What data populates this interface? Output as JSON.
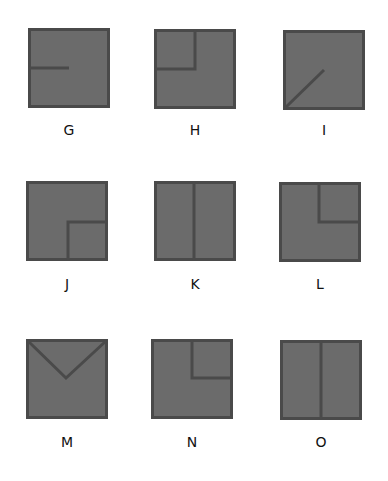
{
  "colors": {
    "fill": "#6b6b6b",
    "stroke": "#4a4a4a",
    "background": "#ffffff",
    "label": "#111111"
  },
  "tiles": [
    {
      "label": "G",
      "x": 28,
      "y": 28,
      "label_y": 122,
      "pattern": "half-horizontal-line-from-left-edge-to-center"
    },
    {
      "label": "H",
      "x": 154,
      "y": 29,
      "label_y": 122,
      "pattern": "top-left-quadrant-outline"
    },
    {
      "label": "I",
      "x": 283,
      "y": 30,
      "label_y": 122,
      "pattern": "diagonal-from-bottom-left-corner-to-center"
    },
    {
      "label": "J",
      "x": 26,
      "y": 181,
      "label_y": 276,
      "pattern": "bottom-right-quadrant-outline"
    },
    {
      "label": "K",
      "x": 154,
      "y": 181,
      "label_y": 276,
      "pattern": "full-vertical-center-line"
    },
    {
      "label": "L",
      "x": 279,
      "y": 182,
      "label_y": 276,
      "pattern": "top-right-quadrant-outline"
    },
    {
      "label": "M",
      "x": 26,
      "y": 339,
      "label_y": 434,
      "pattern": "v-from-top-corners-to-center"
    },
    {
      "label": "N",
      "x": 151,
      "y": 339,
      "label_y": 434,
      "pattern": "top-right-quadrant-outline"
    },
    {
      "label": "O",
      "x": 280,
      "y": 340,
      "label_y": 434,
      "pattern": "full-vertical-center-line"
    }
  ]
}
